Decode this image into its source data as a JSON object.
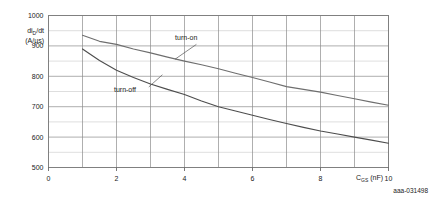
{
  "figure": {
    "code": "aaa-031498",
    "background_color": "#ffffff",
    "frame_color": "#808080",
    "gridline_major_color": "#8c8c8c",
    "gridline_minor_color": "#c8c8c8"
  },
  "chart_data": {
    "type": "line",
    "title": "",
    "subtitle": "",
    "xlabel": "C_GS (nF)",
    "xlabel_base": "C",
    "xlabel_sub": "GS",
    "xlabel_unit": "(nF)",
    "ylabel": "di_D/dt (A/us)",
    "ylabel_base": "di",
    "ylabel_sub": "D",
    "ylabel_rest": "/dt",
    "ylabel_unit": "(A/µs)",
    "xlim": [
      0,
      10
    ],
    "ylim": [
      500,
      1000
    ],
    "xticks": [
      0,
      2,
      4,
      6,
      8,
      10
    ],
    "yticks": [
      500,
      600,
      700,
      800,
      900,
      1000
    ],
    "xtick_labels": [
      "0",
      "2",
      "4",
      "6",
      "8",
      "10"
    ],
    "ytick_labels": [
      "500",
      "600",
      "700",
      "800",
      "900",
      "1000"
    ],
    "x_minor_step": 1,
    "y_minor_step": 50,
    "grid": true,
    "legend": "inline-annotations",
    "series": [
      {
        "name": "turn-on",
        "color": "#6e6e6e",
        "label_x": 4.05,
        "label_y": 920,
        "leader_from_x": 4.35,
        "leader_from_y": 905,
        "leader_to_x": 3.72,
        "leader_to_y": 856,
        "x": [
          1,
          1.5,
          2,
          2.5,
          3,
          3.5,
          4,
          4.5,
          5,
          5.5,
          6,
          6.5,
          7,
          7.5,
          8,
          8.5,
          9,
          9.5,
          10
        ],
        "values": [
          935,
          915,
          905,
          890,
          877,
          863,
          850,
          838,
          825,
          810,
          796,
          781,
          766,
          757,
          748,
          737,
          726,
          715,
          705
        ]
      },
      {
        "name": "turn-off",
        "color": "#4d4d4d",
        "label_x": 2.25,
        "label_y": 748,
        "leader_from_x": 2.95,
        "leader_from_y": 765,
        "leader_to_x": 3.35,
        "leader_to_y": 805,
        "x": [
          1,
          1.5,
          2,
          2.5,
          3,
          3.5,
          4,
          4.5,
          5,
          5.5,
          6,
          6.5,
          7,
          7.5,
          8,
          8.5,
          9,
          9.5,
          10
        ],
        "values": [
          890,
          852,
          820,
          796,
          775,
          757,
          740,
          719,
          700,
          686,
          672,
          658,
          645,
          632,
          620,
          610,
          600,
          590,
          580
        ]
      }
    ]
  }
}
